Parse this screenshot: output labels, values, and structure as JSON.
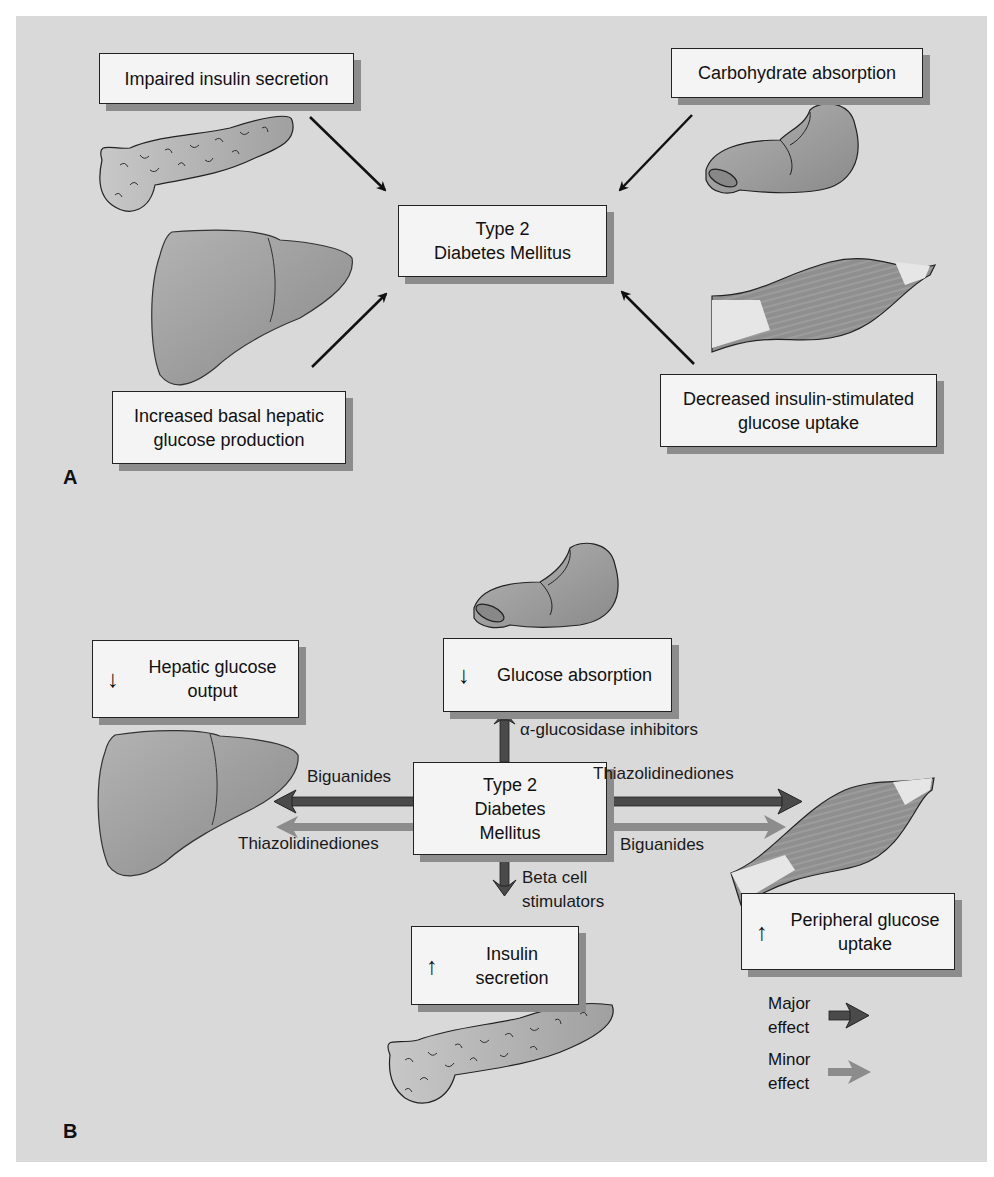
{
  "panel_a": {
    "letter": "A",
    "center": "Type 2\nDiabetes Mellitus",
    "boxes": {
      "impaired_insulin": "Impaired insulin secretion",
      "carbohydrate": "Carbohydrate absorption",
      "hepatic": "Increased basal hepatic\nglucose production",
      "uptake": "Decreased insulin-stimulated\nglucose uptake"
    },
    "organs": [
      "pancreas",
      "intestine",
      "liver",
      "muscle"
    ]
  },
  "panel_b": {
    "letter": "B",
    "center": "Type 2\nDiabetes\nMellitus",
    "boxes": {
      "hepatic_output": {
        "direction": "↓",
        "text": "Hepatic glucose\noutput"
      },
      "glucose_absorption": {
        "direction": "↓",
        "text": "Glucose absorption"
      },
      "insulin_secretion": {
        "direction": "↑",
        "text": "Insulin\nsecretion"
      },
      "peripheral_uptake": {
        "direction": "↑",
        "text": "Peripheral glucose\nuptake"
      }
    },
    "arrow_labels": {
      "alpha": "α-glucosidase inhibitors",
      "left_major": "Biguanides",
      "left_minor": "Thiazolidinediones",
      "right_major": "Thiazolidinediones",
      "right_minor": "Biguanides",
      "down": "Beta cell\nstimulators"
    },
    "legend": {
      "major": "Major\neffect",
      "minor": "Minor\neffect"
    }
  },
  "colors": {
    "background": "#d9d9d9",
    "box_fill": "#f4f4f4",
    "major_arrow": "#4a4a4a",
    "minor_arrow": "#8c8c8c",
    "organ_fill": "#9a9a9a"
  }
}
